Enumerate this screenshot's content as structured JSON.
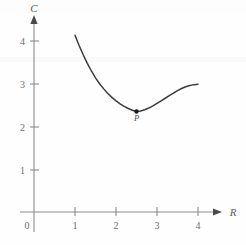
{
  "figure": {
    "name": "average-cost-curve",
    "background_color": "#fefefe",
    "curve_color": "#3b3b3b",
    "axis_color": "#8a8a8a",
    "text_color": "#6e6e6e"
  },
  "axes": {
    "y_axis_label": "C",
    "x_axis_label": "R",
    "origin_label": "0",
    "x_tick_labels": [
      "1",
      "2",
      "3",
      "4"
    ],
    "y_tick_labels": [
      "1",
      "2",
      "3",
      "4"
    ]
  },
  "annotations": {
    "point_label": "P"
  },
  "chart_data": {
    "type": "line",
    "title": "",
    "xlabel": "R",
    "ylabel": "C",
    "xlim": [
      0,
      4.5
    ],
    "ylim": [
      0,
      4.6
    ],
    "xticks": [
      1,
      2,
      3,
      4
    ],
    "yticks": [
      1,
      2,
      3,
      4
    ],
    "grid": false,
    "legend": null,
    "series": [
      {
        "name": "C(R)",
        "x": [
          1.0,
          1.1,
          1.2,
          1.3,
          1.4,
          1.5,
          1.6,
          1.7,
          1.8,
          1.9,
          2.0,
          2.1,
          2.2,
          2.3,
          2.4,
          2.5,
          2.6,
          2.7,
          2.8,
          2.9,
          3.0,
          3.1,
          3.2,
          3.3,
          3.4,
          3.5,
          3.6,
          3.7,
          3.8,
          3.9,
          4.0
        ],
        "y": [
          4.15,
          3.91,
          3.69,
          3.49,
          3.31,
          3.15,
          3.01,
          2.89,
          2.78,
          2.69,
          2.61,
          2.54,
          2.48,
          2.43,
          2.39,
          2.36,
          2.37,
          2.4,
          2.44,
          2.49,
          2.55,
          2.61,
          2.67,
          2.73,
          2.79,
          2.85,
          2.9,
          2.94,
          2.97,
          2.99,
          3.0
        ]
      }
    ],
    "annotations": [
      {
        "label": "P",
        "x": 2.5,
        "y": 2.36,
        "marker": "dot",
        "note": "minimum point of the curve"
      }
    ]
  }
}
